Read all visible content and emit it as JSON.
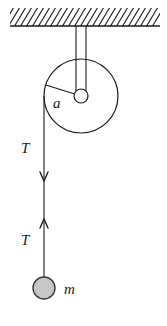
{
  "figure": {
    "name": "pulley-and-hanging-mass-free-body-diagram",
    "background_color": "#ffffff",
    "stroke_color": "#1a1a1a",
    "labels": {
      "radius": "a",
      "tension_upper": "T",
      "tension_lower": "T",
      "mass": "m"
    },
    "ceiling": {
      "name": "hatched-ceiling",
      "line_y": 26,
      "line_x_start": 10,
      "line_x_end": 160,
      "hatch_count": 24,
      "hatch_angle_deg": 55
    },
    "bracket": {
      "name": "pulley-support-bracket",
      "left_x": 76,
      "right_x": 86,
      "top_y": 26,
      "bottom_y": 100
    },
    "pulley": {
      "name": "pulley-wheel",
      "center_x": 81,
      "center_y": 96,
      "radius": 37,
      "axle_radius": 7,
      "radius_line_end_x": 46,
      "radius_line_end_y": 85
    },
    "rope": {
      "name": "rope-segment",
      "x": 44,
      "top_y": 96,
      "bottom_y": 277,
      "arrow_down_y": 180,
      "arrow_up_y": 220
    },
    "mass_ball": {
      "name": "hanging-mass",
      "center_x": 44,
      "center_y": 288,
      "radius": 11,
      "fill_color": "#c9c9c9",
      "stroke_color": "#3a3a3a"
    }
  }
}
